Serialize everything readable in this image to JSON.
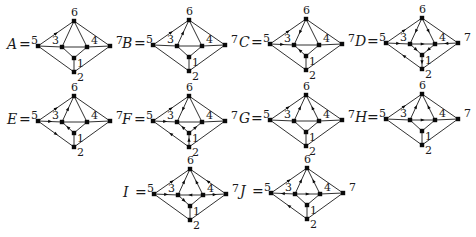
{
  "layout": {
    "node_offsets": {
      "5": [
        0,
        0
      ],
      "6": [
        36,
        -25
      ],
      "3": [
        24,
        1
      ],
      "4": [
        49,
        1
      ],
      "7": [
        72,
        0
      ],
      "1": [
        36,
        12
      ],
      "2": [
        36,
        26
      ]
    },
    "node_label_offsets": {
      "5": [
        -7,
        -2
      ],
      "6": [
        -3,
        -5
      ],
      "3": [
        -10,
        -3
      ],
      "4": [
        4,
        -3
      ],
      "7": [
        6,
        -2
      ],
      "1": [
        3,
        9
      ],
      "2": [
        3,
        9
      ]
    },
    "edges": [
      [
        "5",
        "6"
      ],
      [
        "6",
        "7"
      ],
      [
        "5",
        "2"
      ],
      [
        "2",
        "7"
      ],
      [
        "5",
        "3"
      ],
      [
        "3",
        "4"
      ],
      [
        "4",
        "7"
      ],
      [
        "6",
        "3"
      ],
      [
        "6",
        "4"
      ],
      [
        "3",
        "1"
      ],
      [
        "4",
        "1"
      ],
      [
        "1",
        "2"
      ]
    ]
  },
  "graphs": [
    {
      "name": "A",
      "label": "A",
      "origin": [
        38,
        46
      ],
      "arrows": [
        [
          "5",
          "6"
        ]
      ]
    },
    {
      "name": "B",
      "label": "B",
      "origin": [
        153,
        45
      ],
      "arrows": [
        [
          "5",
          "6"
        ],
        [
          "3",
          "6"
        ]
      ]
    },
    {
      "name": "C",
      "label": "C",
      "origin": [
        270,
        44
      ],
      "arrows": [
        [
          "5",
          "6"
        ],
        [
          "6",
          "3"
        ],
        [
          "5",
          "3"
        ],
        [
          "1",
          "3"
        ]
      ]
    },
    {
      "name": "D",
      "label": "D",
      "origin": [
        386,
        43
      ],
      "arrows": [
        [
          "5",
          "6"
        ],
        [
          "6",
          "3"
        ],
        [
          "6",
          "4"
        ],
        [
          "5",
          "3"
        ],
        [
          "3",
          "4"
        ],
        [
          "7",
          "4"
        ],
        [
          "3",
          "1"
        ],
        [
          "4",
          "1"
        ],
        [
          "2",
          "5"
        ],
        [
          "1",
          "2"
        ]
      ]
    },
    {
      "name": "E",
      "label": "E",
      "origin": [
        38,
        121
      ],
      "arrows": [
        [
          "5",
          "6"
        ],
        [
          "3",
          "6"
        ],
        [
          "5",
          "3"
        ],
        [
          "1",
          "3"
        ],
        [
          "5",
          "2"
        ]
      ]
    },
    {
      "name": "F",
      "label": "F",
      "origin": [
        153,
        121
      ],
      "arrows": [
        [
          "5",
          "6"
        ],
        [
          "6",
          "3"
        ],
        [
          "5",
          "3"
        ],
        [
          "1",
          "3"
        ],
        [
          "1",
          "4"
        ],
        [
          "2",
          "1"
        ],
        [
          "2",
          "5"
        ]
      ]
    },
    {
      "name": "G",
      "label": "G",
      "origin": [
        270,
        120
      ],
      "arrows": [
        [
          "5",
          "6"
        ],
        [
          "3",
          "6"
        ],
        [
          "4",
          "6"
        ]
      ]
    },
    {
      "name": "H",
      "label": "H",
      "origin": [
        386,
        119
      ],
      "arrows": [
        [
          "5",
          "6"
        ],
        [
          "3",
          "6"
        ],
        [
          "4",
          "6"
        ],
        [
          "3",
          "4"
        ]
      ]
    },
    {
      "name": "I",
      "label": "I",
      "origin": [
        154,
        194
      ],
      "arrows": [
        [
          "5",
          "6"
        ],
        [
          "3",
          "6"
        ],
        [
          "4",
          "6"
        ],
        [
          "7",
          "6"
        ],
        [
          "5",
          "3"
        ],
        [
          "4",
          "3"
        ],
        [
          "4",
          "7"
        ],
        [
          "3",
          "1"
        ]
      ]
    },
    {
      "name": "J",
      "label": "J",
      "origin": [
        271,
        193
      ],
      "arrows": [
        [
          "5",
          "6"
        ],
        [
          "3",
          "6"
        ],
        [
          "4",
          "6"
        ],
        [
          "3",
          "5"
        ],
        [
          "3",
          "4"
        ],
        [
          "2",
          "5"
        ]
      ]
    }
  ],
  "equals_sign": "="
}
